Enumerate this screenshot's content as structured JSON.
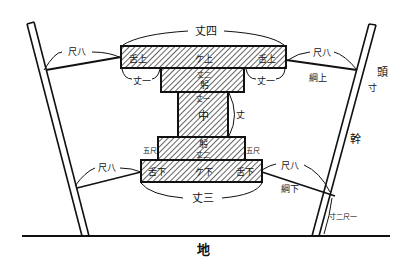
{
  "diagram": {
    "type": "technical-diagram",
    "colors": {
      "ink": "#111111",
      "paper": "#ffffff"
    },
    "labels": {
      "top_width": "丈四",
      "upper_beam_center": "ケ上",
      "upper_beam_left_end": "舌上",
      "upper_beam_right_end": "舌上",
      "upper_left_overhang": "丈一",
      "upper_right_overhang": "丈一",
      "upper_inner_width": "丈二",
      "upper_step": "躬",
      "column_top_width": "丈一",
      "column_center": "中",
      "column_height": "丈",
      "lower_step": "躬",
      "lower_inner_width": "丈二",
      "lower_beam_center": "ケ下",
      "lower_beam_left_end": "舌下",
      "lower_beam_right_end": "舌下",
      "lower_left_tick": "五尺",
      "lower_right_tick": "五尺",
      "bottom_width": "丈三",
      "rope_upper_left": "尺八",
      "rope_upper_right": "尺八",
      "rope_upper_right_name": "綱上",
      "rope_lower_left": "尺八",
      "rope_lower_right": "尺八",
      "rope_lower_right_name": "綱下",
      "pole_top_right": "頭",
      "pole_top_right_sub": "寸",
      "pole_trunk": "幹",
      "pole_base_measure": "寸二尺一",
      "ground": "地"
    }
  }
}
